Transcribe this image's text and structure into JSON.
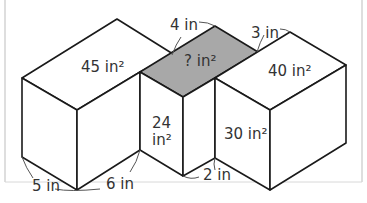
{
  "figure": {
    "colors": {
      "background": "#ffffff",
      "face": "#ffffff",
      "shaded_face": "#a8a8a8",
      "line": "#1a1a1a",
      "text": "#333333",
      "frame": "#bdbdbd"
    },
    "area_labels": {
      "top_left": "45 in²",
      "top_middle": "? in²",
      "top_right": "40 in²",
      "front_middle": "24",
      "front_middle_unit": "in²",
      "front_right": "30 in²"
    },
    "length_labels": {
      "top_a": "4 in",
      "top_b": "3 in",
      "bottom_a": "5 in",
      "bottom_b": "6 in",
      "bottom_c": "2 in"
    }
  }
}
